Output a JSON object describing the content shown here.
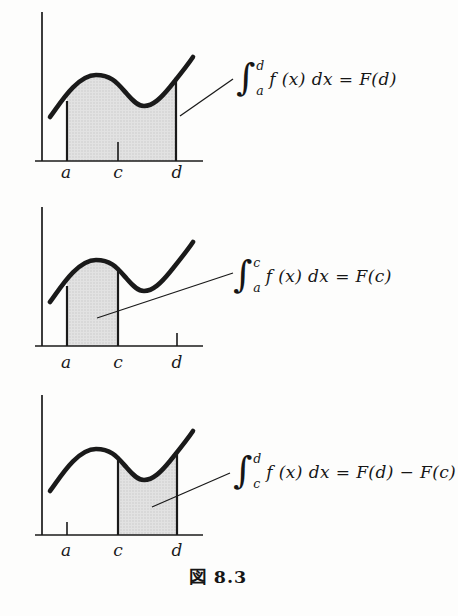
{
  "figure": {
    "caption": "図 8.3",
    "background": "#fdfdfc"
  },
  "colors": {
    "ink": "#1a1a1a",
    "shade_fill": "#e2e2e2",
    "shade_dot": "#c6c6c6"
  },
  "rows": [
    {
      "description": "area under curve shaded from a to d",
      "labels": {
        "a": "a",
        "c": "c",
        "d": "d"
      },
      "formula": {
        "int": "∫",
        "upper": "d",
        "lower": "a",
        "body": "f (x) dx = F(d)"
      }
    },
    {
      "description": "area under curve shaded from a to c",
      "labels": {
        "a": "a",
        "c": "c",
        "d": "d"
      },
      "formula": {
        "int": "∫",
        "upper": "c",
        "lower": "a",
        "body": "f (x) dx = F(c)"
      }
    },
    {
      "description": "area under curve shaded from c to d",
      "labels": {
        "a": "a",
        "c": "c",
        "d": "d"
      },
      "formula": {
        "int": "∫",
        "upper": "d",
        "lower": "c",
        "body": "f (x) dx = F(d) − F(c)"
      }
    }
  ]
}
